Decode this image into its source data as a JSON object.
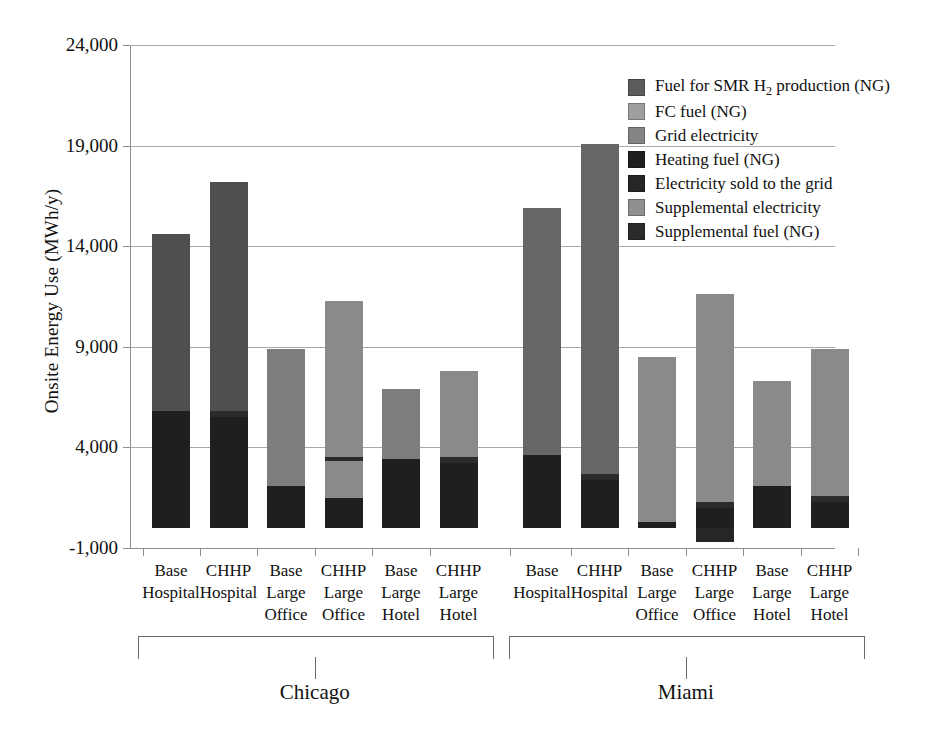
{
  "chart_data": {
    "type": "bar",
    "stacked": true,
    "title": "",
    "xlabel": "",
    "ylabel": "Onsite Energy Use (MWh/y)",
    "ylim": [
      -1000,
      24000
    ],
    "yticks": [
      -1000,
      4000,
      9000,
      14000,
      19000,
      24000
    ],
    "ytick_labels": [
      "-1,000",
      "4,000",
      "9,000",
      "14,000",
      "19,000",
      "24,000"
    ],
    "grid": "horizontal",
    "legend_position": "top-right",
    "groups": [
      {
        "name": "Chicago",
        "categories": [
          0,
          1,
          2,
          3,
          4,
          5
        ]
      },
      {
        "name": "Miami",
        "categories": [
          6,
          7,
          8,
          9,
          10,
          11
        ]
      }
    ],
    "categories": [
      "Base Hospital",
      "CHHP Hospital",
      "Base Large Office",
      "CHHP Large Office",
      "Base Large Hotel",
      "CHHP Large Hotel",
      "Base Hospital",
      "CHHP Hospital",
      "Base Large Office",
      "CHHP Large Office",
      "Base Large Hotel",
      "CHHP Large Hotel"
    ],
    "category_lines": [
      [
        "Base",
        "Hospital"
      ],
      [
        "CHHP",
        "Hospital"
      ],
      [
        "Base",
        "Large",
        "Office"
      ],
      [
        "CHHP",
        "Large",
        "Office"
      ],
      [
        "Base",
        "Large",
        "Hotel"
      ],
      [
        "CHHP",
        "Large",
        "Hotel"
      ],
      [
        "Base",
        "Hospital"
      ],
      [
        "CHHP",
        "Hospital"
      ],
      [
        "Base",
        "Large",
        "Office"
      ],
      [
        "CHHP",
        "Large",
        "Office"
      ],
      [
        "Base",
        "Large",
        "Hotel"
      ],
      [
        "CHHP",
        "Large",
        "Hotel"
      ]
    ],
    "series": [
      {
        "name": "Fuel for SMR H2 production (NG)",
        "color": "#5b5b5b",
        "values": [
          0,
          0,
          0,
          0,
          0,
          0,
          0,
          0,
          0,
          0,
          0,
          0
        ]
      },
      {
        "name": "FC fuel (NG)",
        "color": "#9e9e9e",
        "values": [
          0,
          0,
          0,
          0,
          0,
          0,
          0,
          0,
          0,
          0,
          0,
          0
        ]
      },
      {
        "name": "Grid electricity",
        "color": "#848484",
        "values": [
          8800,
          12200,
          6800,
          9600,
          4700,
          5100,
          12800,
          16000,
          8200,
          8700,
          5700,
          7600
        ]
      },
      {
        "name": "Heating fuel (NG)",
        "color": "#1f1f1f",
        "values": [
          5800,
          5300,
          2200,
          1700,
          3500,
          3400,
          3700,
          2500,
          300,
          1100,
          2200,
          1400
        ]
      },
      {
        "name": "Electricity sold to the grid",
        "color": "#262626",
        "values": [
          0,
          0,
          0,
          0,
          0,
          0,
          0,
          0,
          0,
          -700,
          0,
          0
        ]
      },
      {
        "name": "Supplemental electricity",
        "color": "#8f8f8f",
        "values": [
          0,
          0,
          0,
          0,
          0,
          0,
          0,
          0,
          0,
          0,
          0,
          0
        ]
      },
      {
        "name": "Supplemental fuel (NG)",
        "color": "#2b2b2b",
        "values": [
          0,
          300,
          0,
          200,
          0,
          200,
          0,
          300,
          0,
          300,
          0,
          200
        ]
      }
    ],
    "bars": [
      {
        "index": 0,
        "total": 14600,
        "segments": [
          {
            "series": "Heating fuel (NG)",
            "from": 0,
            "to": 5800,
            "color": "#1f1f1f"
          },
          {
            "series": "Grid electricity",
            "from": 5800,
            "to": 14600,
            "color": "#4f4f4f"
          }
        ]
      },
      {
        "index": 1,
        "total": 17200,
        "segments": [
          {
            "series": "Heating fuel (NG)",
            "from": 0,
            "to": 5500,
            "color": "#1f1f1f"
          },
          {
            "series": "Supplemental fuel (NG)",
            "from": 5500,
            "to": 5800,
            "color": "#2b2b2b"
          },
          {
            "series": "Grid electricity",
            "from": 5800,
            "to": 17200,
            "color": "#4f4f4f"
          }
        ]
      },
      {
        "index": 2,
        "total": 8900,
        "segments": [
          {
            "series": "Heating fuel (NG)",
            "from": 0,
            "to": 2100,
            "color": "#1f1f1f"
          },
          {
            "series": "Grid electricity",
            "from": 2100,
            "to": 8900,
            "color": "#7d7d7d"
          }
        ]
      },
      {
        "index": 3,
        "total": 11300,
        "segments": [
          {
            "series": "Heating fuel (NG)",
            "from": 0,
            "to": 1500,
            "color": "#1f1f1f"
          },
          {
            "series": "Grid electricity",
            "from": 1500,
            "to": 3300,
            "color": "#8a8a8a"
          },
          {
            "series": "Supplemental fuel (NG)",
            "from": 3300,
            "to": 3500,
            "color": "#2b2b2b"
          },
          {
            "series": "FC fuel (NG)",
            "from": 3500,
            "to": 11300,
            "color": "#8a8a8a"
          }
        ]
      },
      {
        "index": 4,
        "total": 6900,
        "segments": [
          {
            "series": "Heating fuel (NG)",
            "from": 0,
            "to": 3400,
            "color": "#1f1f1f"
          },
          {
            "series": "Grid electricity",
            "from": 3400,
            "to": 6900,
            "color": "#7d7d7d"
          }
        ]
      },
      {
        "index": 5,
        "total": 7800,
        "segments": [
          {
            "series": "Heating fuel (NG)",
            "from": 0,
            "to": 3200,
            "color": "#1f1f1f"
          },
          {
            "series": "Supplemental fuel (NG)",
            "from": 3200,
            "to": 3500,
            "color": "#2b2b2b"
          },
          {
            "series": "FC fuel (NG)",
            "from": 3500,
            "to": 7800,
            "color": "#8a8a8a"
          }
        ]
      },
      {
        "index": 6,
        "total": 15900,
        "segments": [
          {
            "series": "Heating fuel (NG)",
            "from": 0,
            "to": 3600,
            "color": "#1f1f1f"
          },
          {
            "series": "Grid electricity",
            "from": 3600,
            "to": 15900,
            "color": "#666666"
          }
        ]
      },
      {
        "index": 7,
        "total": 19100,
        "segments": [
          {
            "series": "Heating fuel (NG)",
            "from": 0,
            "to": 2400,
            "color": "#1f1f1f"
          },
          {
            "series": "Supplemental fuel (NG)",
            "from": 2400,
            "to": 2700,
            "color": "#2b2b2b"
          },
          {
            "series": "Grid electricity",
            "from": 2700,
            "to": 19100,
            "color": "#666666"
          }
        ]
      },
      {
        "index": 8,
        "total": 8500,
        "segments": [
          {
            "series": "Heating fuel (NG)",
            "from": 0,
            "to": 300,
            "color": "#1f1f1f"
          },
          {
            "series": "Grid electricity",
            "from": 300,
            "to": 8500,
            "color": "#8a8a8a"
          }
        ]
      },
      {
        "index": 9,
        "total": 11600,
        "segments": [
          {
            "series": "Electricity sold to the grid",
            "from": -700,
            "to": 0,
            "color": "#262626"
          },
          {
            "series": "Heating fuel (NG)",
            "from": 0,
            "to": 1000,
            "color": "#1f1f1f"
          },
          {
            "series": "Supplemental fuel (NG)",
            "from": 1000,
            "to": 1300,
            "color": "#2b2b2b"
          },
          {
            "series": "FC fuel (NG)",
            "from": 1300,
            "to": 11600,
            "color": "#8a8a8a"
          }
        ]
      },
      {
        "index": 10,
        "total": 7300,
        "segments": [
          {
            "series": "Heating fuel (NG)",
            "from": 0,
            "to": 2100,
            "color": "#1f1f1f"
          },
          {
            "series": "Grid electricity",
            "from": 2100,
            "to": 7300,
            "color": "#8a8a8a"
          }
        ]
      },
      {
        "index": 11,
        "total": 8900,
        "segments": [
          {
            "series": "Heating fuel (NG)",
            "from": 0,
            "to": 1300,
            "color": "#1f1f1f"
          },
          {
            "series": "Supplemental fuel (NG)",
            "from": 1300,
            "to": 1600,
            "color": "#2b2b2b"
          },
          {
            "series": "FC fuel (NG)",
            "from": 1600,
            "to": 8900,
            "color": "#8a8a8a"
          }
        ]
      }
    ]
  },
  "legend": {
    "items": [
      {
        "label_html": "Fuel for SMR H<sub>2</sub> production (NG)",
        "label": "Fuel for SMR H2 production (NG)",
        "color": "#5b5b5b"
      },
      {
        "label_html": "FC fuel (NG)",
        "label": "FC fuel (NG)",
        "color": "#9e9e9e"
      },
      {
        "label_html": "Grid electricity",
        "label": "Grid electricity",
        "color": "#848484"
      },
      {
        "label_html": "Heating fuel (NG)",
        "label": "Heating fuel (NG)",
        "color": "#1f1f1f"
      },
      {
        "label_html": "Electricity sold to the grid",
        "label": "Electricity sold to the grid",
        "color": "#262626"
      },
      {
        "label_html": "Supplemental electricity",
        "label": "Supplemental electricity",
        "color": "#8f8f8f"
      },
      {
        "label_html": "Supplemental fuel (NG)",
        "label": "Supplemental fuel (NG)",
        "color": "#2b2b2b"
      }
    ]
  }
}
